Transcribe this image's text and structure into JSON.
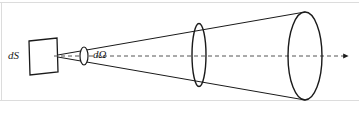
{
  "figure": {
    "canvas": {
      "width": 359,
      "height": 113,
      "background": "#ffffff"
    },
    "border_color": "#d9d9d9",
    "stroke_color": "#1a1a1a",
    "labels": {
      "surface_element": "dS",
      "solid_angle_element": "dΩ"
    },
    "elements": {
      "surface_patch_name": "dS surface element (parallelogram)",
      "solid_angle_patch_name": "dΩ solid angle element (small ellipse)",
      "mid_cross_section_name": "intermediate cone cross-section",
      "far_cross_section_name": "far cone cross-section",
      "axis_name": "central propagation axis (dashed, arrow to right)"
    },
    "geometry": {
      "apex": [
        52,
        56
      ],
      "axis_y": 56,
      "axis_end_x": 350,
      "parallelogram_points": "29,41 57,38 58,72 30,75",
      "domega_ellipse": {
        "cx": 84,
        "cy": 56,
        "rx": 4,
        "ry": 9
      },
      "mid_ellipse": {
        "cx": 199,
        "cy": 55,
        "rx": 7,
        "ry": 31
      },
      "far_ellipse": {
        "cx": 305,
        "cy": 56,
        "rx": 17,
        "ry": 44
      },
      "upper_ray": "52,56 305,12",
      "lower_ray": "52,56 305,100"
    }
  }
}
